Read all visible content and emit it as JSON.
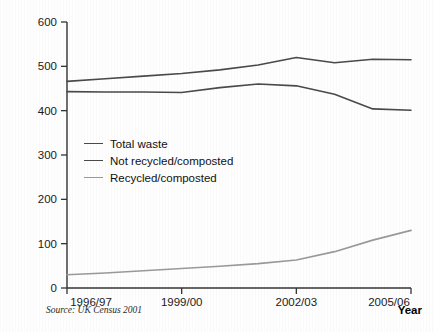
{
  "chart_data": {
    "type": "line",
    "title": "",
    "xlabel": "Year",
    "ylabel": "Waste (kg person⁻¹ yr⁻¹)",
    "source_note": "Source: UK Census 2001",
    "x": [
      "1996/97",
      "1997/98",
      "1998/99",
      "1999/00",
      "2000/01",
      "2001/02",
      "2002/03",
      "2003/04",
      "2004/05",
      "2005/06"
    ],
    "xticks": [
      "1996/97",
      "1999/00",
      "2002/03",
      "2005/06"
    ],
    "xtick_indices": [
      0,
      3,
      6,
      9
    ],
    "yticks": [
      0,
      100,
      200,
      300,
      400,
      500,
      600
    ],
    "ylim": [
      0,
      600
    ],
    "grid": false,
    "legend_position": "inside-left",
    "series": [
      {
        "name": "Total waste",
        "color": "#4a4a4a",
        "values": [
          466,
          472,
          478,
          484,
          492,
          503,
          520,
          508,
          516,
          515
        ]
      },
      {
        "name": "Not recycled/composted",
        "color": "#4a4a4a",
        "values": [
          443,
          442,
          442,
          441,
          452,
          460,
          456,
          437,
          404,
          401
        ]
      },
      {
        "name": "Recycled/composted",
        "color": "#9a9a9a",
        "values": [
          30,
          34,
          39,
          44,
          49,
          55,
          63,
          82,
          108,
          130
        ]
      }
    ]
  },
  "axis": {
    "tick_color": "#333333",
    "axis_color": "#333333"
  }
}
